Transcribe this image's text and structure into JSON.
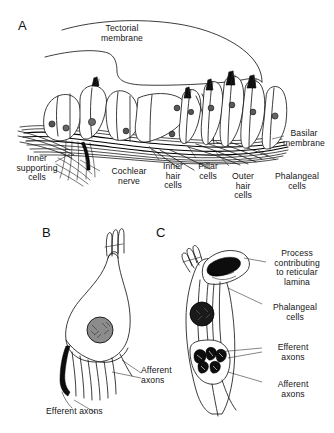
{
  "figure": {
    "background_color": "#ffffff",
    "ink_color": "#1a1a1a",
    "panels": [
      {
        "letter": "A",
        "name": "organ-of-corti-overview",
        "labels": [
          {
            "id": "tectorial-membrane",
            "text": "Tectorial\nmembrane"
          },
          {
            "id": "basilar-membrane",
            "text": "Basilar\nmembrane"
          },
          {
            "id": "inner-supporting-cells",
            "text": "Inner\nsupporting\ncells"
          },
          {
            "id": "cochlear-nerve",
            "text": "Cochlear\nnerve"
          },
          {
            "id": "inner-hair-cells",
            "text": "Inner\nhair\ncells"
          },
          {
            "id": "pillar-cells",
            "text": "Pillar\ncells"
          },
          {
            "id": "outer-hair-cells",
            "text": "Outer\nhair\ncells"
          },
          {
            "id": "phalangeal-cells",
            "text": "Phalangeal\ncells"
          }
        ]
      },
      {
        "letter": "B",
        "name": "inner-hair-cell",
        "labels": [
          {
            "id": "afferent-axons",
            "text": "Afferent\naxons"
          },
          {
            "id": "efferent-axons",
            "text": "Efferent axons"
          }
        ]
      },
      {
        "letter": "C",
        "name": "outer-hair-cell",
        "labels": [
          {
            "id": "process-reticular-lamina",
            "text": "Process\ncontributing\nto reticular\nlamina"
          },
          {
            "id": "phalangeal-cells",
            "text": "Phalangeal\ncells"
          },
          {
            "id": "efferent-axons",
            "text": "Efferent\naxons"
          },
          {
            "id": "afferent-axons",
            "text": "Afferent\naxons"
          }
        ]
      }
    ]
  }
}
